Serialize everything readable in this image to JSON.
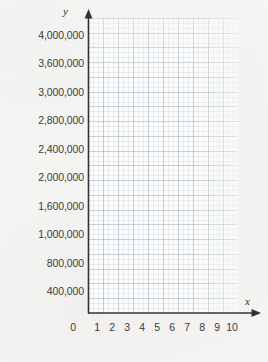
{
  "figure": {
    "type": "blank-coordinate-grid",
    "background_color": "#f5f5f3",
    "grid_color": "#96a8b6",
    "axis_color": "#333333",
    "text_color": "#3b3b3b"
  },
  "axes": {
    "x_axis_name": "x",
    "y_axis_name": "y",
    "x_arrow": "arrow-right",
    "y_arrow": "arrow-up"
  },
  "chart_data": {
    "type": "line",
    "title": "",
    "subtitle": "",
    "xlabel": "x",
    "ylabel": "y",
    "series": [],
    "x": [
      0,
      1,
      2,
      3,
      4,
      5,
      6,
      7,
      8,
      9,
      10
    ],
    "xticklabels": [
      "0",
      "1",
      "2",
      "3",
      "4",
      "5",
      "6",
      "7",
      "8",
      "9",
      "10"
    ],
    "yticklabels": [
      "400,000",
      "800,000",
      "1,000,000",
      "1,600,000",
      "2,000,000",
      "2,400,000",
      "2,800,000",
      "3,000,000",
      "3,600,000",
      "4,000,000"
    ],
    "ytickvalues": [
      400000,
      800000,
      1000000,
      1600000,
      2000000,
      2400000,
      2800000,
      3000000,
      3600000,
      4000000
    ],
    "xlim": [
      0,
      10
    ],
    "ylim": [
      0,
      4000000
    ],
    "grid": true,
    "minor_grid": true,
    "legend": "none",
    "annotations": [],
    "note": "Empty graph paper — no data plotted"
  },
  "yticks": [
    {
      "label": "4,000,000",
      "top": 29
    },
    {
      "label": "3,600,000",
      "top": 57
    },
    {
      "label": "3,000,000",
      "top": 86
    },
    {
      "label": "2,800,000",
      "top": 114
    },
    {
      "label": "2,400,000",
      "top": 143
    },
    {
      "label": "2,000,000",
      "top": 171
    },
    {
      "label": "1,600,000",
      "top": 200
    },
    {
      "label": "1,000,000",
      "top": 228
    },
    {
      "label": "800,000",
      "top": 257
    },
    {
      "label": "400,000",
      "top": 285
    }
  ],
  "xticks": [
    {
      "label": "0",
      "left": 64
    },
    {
      "label": "1",
      "left": 88
    },
    {
      "label": "2",
      "left": 103
    },
    {
      "label": "3",
      "left": 118
    },
    {
      "label": "4",
      "left": 133
    },
    {
      "label": "5",
      "left": 148
    },
    {
      "label": "6",
      "left": 163
    },
    {
      "label": "7",
      "left": 178
    },
    {
      "label": "8",
      "left": 193
    },
    {
      "label": "9",
      "left": 208
    },
    {
      "label": "10",
      "left": 223
    }
  ]
}
